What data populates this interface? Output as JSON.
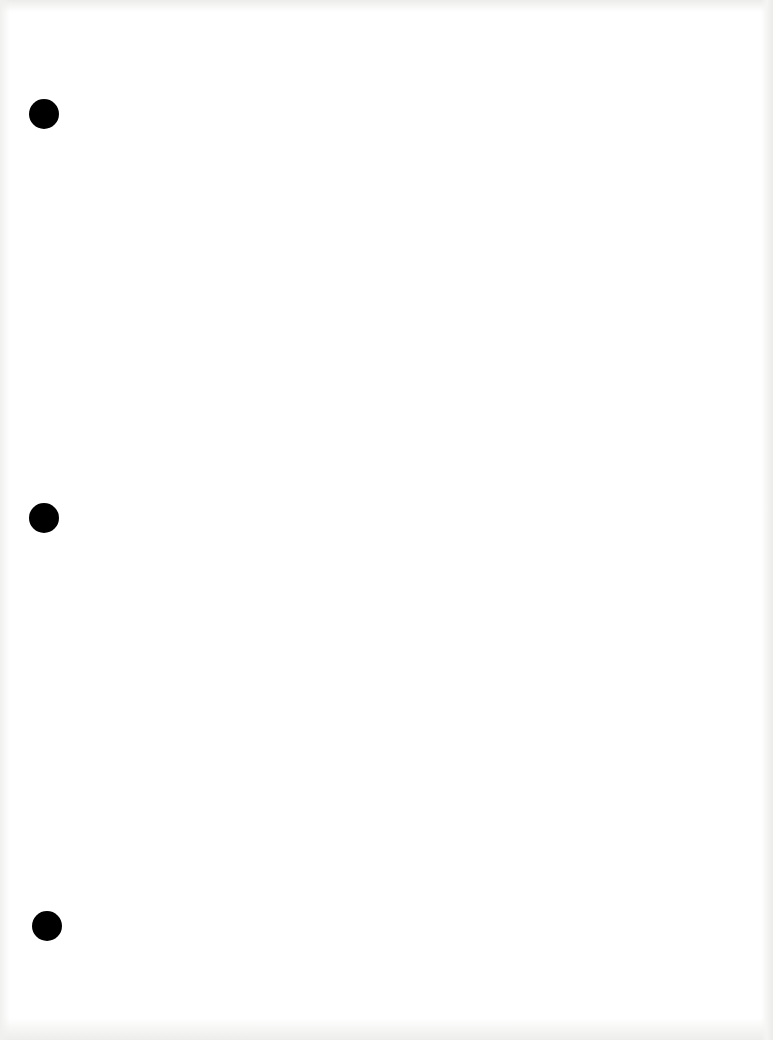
{
  "document": {
    "type": "blank-scanned-page",
    "background_color": "#ffffff",
    "content_text": "",
    "punch_holes": [
      {
        "cx": 44,
        "cy": 114,
        "diameter": 30,
        "color": "#000000"
      },
      {
        "cx": 44,
        "cy": 518,
        "diameter": 30,
        "color": "#000000"
      },
      {
        "cx": 47,
        "cy": 926,
        "diameter": 30,
        "color": "#000000"
      }
    ]
  }
}
